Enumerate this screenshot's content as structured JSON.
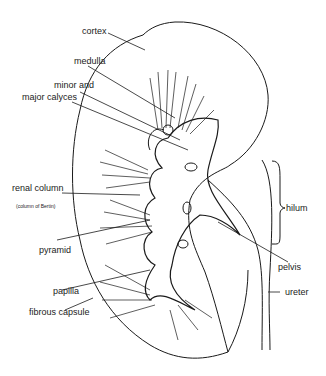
{
  "diagram": {
    "labels": {
      "cortex": "cortex",
      "medulla": "medulla",
      "calyces_line1": "minor and",
      "calyces_line2": "major calyces",
      "renal_column": "renal  column",
      "renal_column_sub": "(column of Bertin)",
      "pyramid": "pyramid",
      "papilla": "papilla",
      "fibrous_capsule": "fibrous capsule",
      "hilum": "hilum",
      "pelvis": "pelvis",
      "ureter": "ureter"
    },
    "colors": {
      "ink": "#1a1a1a",
      "background": "#ffffff"
    }
  }
}
